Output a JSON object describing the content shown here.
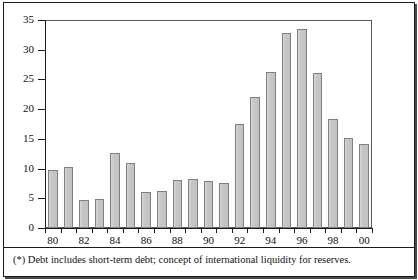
{
  "chart_data": {
    "type": "bar",
    "title": "",
    "xlabel": "",
    "ylabel": "",
    "ylim": [
      0,
      35
    ],
    "yticks": [
      0,
      5,
      10,
      15,
      20,
      25,
      30,
      35
    ],
    "grid": false,
    "legend": null,
    "categories": [
      "80",
      "81",
      "82",
      "83",
      "84",
      "85",
      "86",
      "87",
      "88",
      "89",
      "90",
      "91",
      "92",
      "93",
      "94",
      "95",
      "96",
      "97",
      "98",
      "99",
      "00"
    ],
    "xtick_labels_shown": [
      "80",
      "82",
      "84",
      "86",
      "88",
      "90",
      "92",
      "94",
      "96",
      "98",
      "00"
    ],
    "values": [
      9.7,
      10.2,
      4.7,
      4.9,
      12.7,
      11.0,
      6.1,
      6.2,
      8.1,
      8.3,
      7.9,
      7.5,
      17.5,
      22.1,
      26.2,
      32.8,
      33.5,
      26.1,
      18.4,
      15.1,
      14.1
    ],
    "series": [
      {
        "name": "",
        "values": [
          9.7,
          10.2,
          4.7,
          4.9,
          12.7,
          11.0,
          6.1,
          6.2,
          8.1,
          8.3,
          7.9,
          7.5,
          17.5,
          22.1,
          26.2,
          32.8,
          33.5,
          26.1,
          18.4,
          15.1,
          14.1
        ]
      }
    ],
    "bar_color": "#c9c9c9",
    "bar_border_color": "#808080"
  },
  "caption": {
    "text": "(*) Debt includes short-term debt; concept of international liquidity for reserves."
  }
}
